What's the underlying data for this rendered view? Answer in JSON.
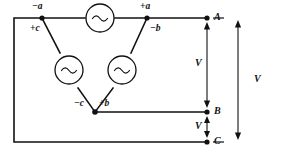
{
  "figure": {
    "type": "three-phase-delta-source-circuit",
    "background_color": "#ffffff",
    "line_color": "#111111"
  },
  "sources": [
    {
      "id": "source-top",
      "symbol": "~",
      "orientation": "horizontal"
    },
    {
      "id": "source-left",
      "symbol": "~",
      "orientation": "diagonal"
    },
    {
      "id": "source-right",
      "symbol": "~",
      "orientation": "diagonal"
    }
  ],
  "terminals": {
    "top_left_upper": "−a",
    "top_left_lower": "+c",
    "top_right_upper": "+a",
    "top_right_lower": "−b",
    "bottom_left": "−c",
    "bottom_right": "+b"
  },
  "points": {
    "a": "A",
    "b": "B",
    "c": "C"
  },
  "dimensions": {
    "v_ab": "V",
    "v_bc": "V",
    "v_ac": "V"
  }
}
